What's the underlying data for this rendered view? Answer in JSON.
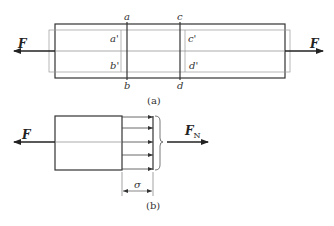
{
  "figure_a": {
    "caption": "(a)",
    "labels": {
      "a": "a",
      "b": "b",
      "c": "c",
      "d": "d",
      "a_prime": "a'",
      "b_prime": "b'",
      "c_prime": "c'",
      "d_prime": "d'"
    },
    "force_left": "F",
    "force_right": "F"
  },
  "figure_b": {
    "caption": "(b)",
    "force_left": "F",
    "resultant": "F",
    "resultant_sub": "N",
    "stress": "σ"
  },
  "colors": {
    "stroke": "#333333",
    "thin": "#888888"
  }
}
